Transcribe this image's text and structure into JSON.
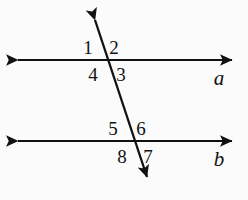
{
  "figure": {
    "kind": "geometry-diagram",
    "background_color": "#fbfbfb",
    "stroke_color": "#111111",
    "text_color": "#111111",
    "width": 248,
    "height": 200
  },
  "lines": [
    {
      "name": "line-a",
      "label": "a",
      "label_x": 219,
      "label_y": 78,
      "x1": 12,
      "y1": 60,
      "x2": 238,
      "y2": 60,
      "arrows": "both",
      "stroke_width": 2.1
    },
    {
      "name": "line-b",
      "label": "b",
      "label_x": 219,
      "label_y": 159,
      "x1": 12,
      "y1": 141,
      "x2": 238,
      "y2": 141,
      "arrows": "both",
      "stroke_width": 2.1
    },
    {
      "name": "transversal",
      "label": "",
      "label_x": 0,
      "label_y": 0,
      "x1": 92,
      "y1": 11,
      "x2": 150,
      "y2": 185,
      "arrows": "both",
      "stroke_width": 2.3
    }
  ],
  "intersections": [
    {
      "name": "upper-intersection",
      "x": 107,
      "y": 60
    },
    {
      "name": "lower-intersection",
      "x": 134,
      "y": 141
    }
  ],
  "angle_labels": [
    {
      "id": "1",
      "text": "1",
      "x": 88,
      "y": 47,
      "position": "upper-left"
    },
    {
      "id": "2",
      "text": "2",
      "x": 114,
      "y": 47,
      "position": "upper-right"
    },
    {
      "id": "3",
      "text": "3",
      "x": 121,
      "y": 74,
      "position": "lower-right"
    },
    {
      "id": "4",
      "text": "4",
      "x": 93,
      "y": 74,
      "position": "lower-left"
    },
    {
      "id": "5",
      "text": "5",
      "x": 113,
      "y": 128,
      "position": "upper-left"
    },
    {
      "id": "6",
      "text": "6",
      "x": 141,
      "y": 128,
      "position": "upper-right"
    },
    {
      "id": "7",
      "text": "7",
      "x": 148,
      "y": 156,
      "position": "lower-right"
    },
    {
      "id": "8",
      "text": "8",
      "x": 122,
      "y": 156,
      "position": "lower-left"
    }
  ]
}
